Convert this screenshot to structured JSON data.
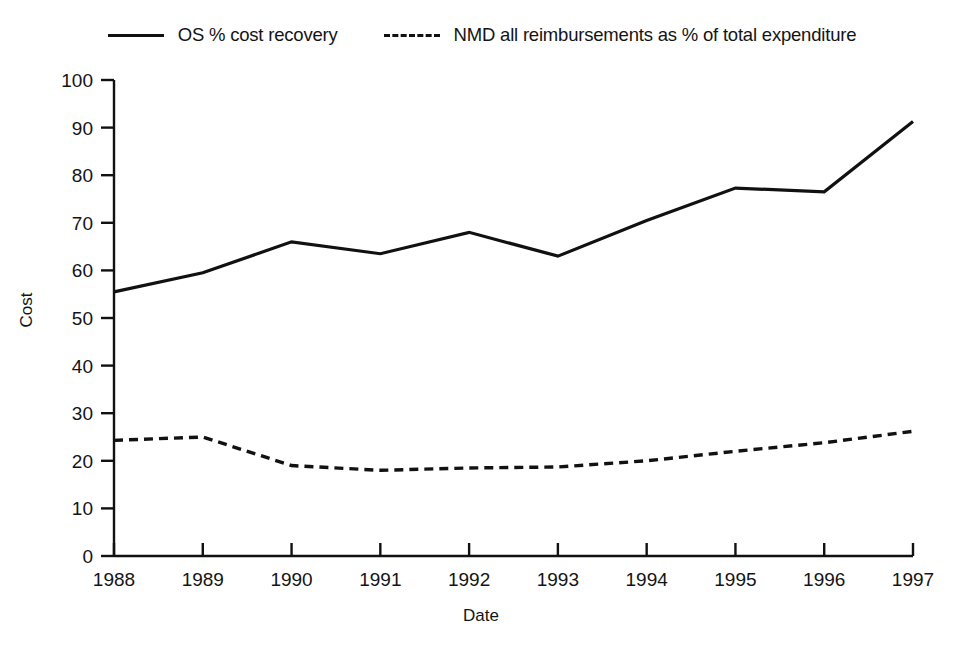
{
  "chart_data": {
    "type": "line",
    "title": "",
    "xlabel": "Date",
    "ylabel": "Cost",
    "x": [
      1988,
      1989,
      1990,
      1991,
      1992,
      1993,
      1994,
      1995,
      1996,
      1997
    ],
    "xtick_labels": [
      "1988",
      "1989",
      "1990",
      "1991",
      "1992",
      "1993",
      "1994",
      "1995",
      "1996",
      "1997"
    ],
    "ytick_labels": [
      "0",
      "10",
      "20",
      "30",
      "40",
      "50",
      "60",
      "70",
      "80",
      "90",
      "100"
    ],
    "yticks": [
      0,
      10,
      20,
      30,
      40,
      50,
      60,
      70,
      80,
      90,
      100
    ],
    "ylim": [
      0,
      100
    ],
    "xlim": [
      1988,
      1997
    ],
    "grid": false,
    "legend_position": "top-center",
    "series": [
      {
        "name": "OS % cost recovery",
        "style": "solid",
        "color": "#111111",
        "values": [
          55.5,
          59.5,
          66.0,
          63.5,
          68.0,
          63.0,
          70.5,
          77.3,
          76.5,
          91.3
        ]
      },
      {
        "name": "NMD all reimbursements as % of total expenditure",
        "style": "dashed",
        "color": "#111111",
        "values": [
          24.3,
          25.0,
          19.0,
          18.0,
          18.5,
          18.7,
          20.0,
          22.0,
          23.8,
          26.2
        ]
      }
    ]
  },
  "legend": {
    "entries": [
      {
        "label": "OS % cost recovery",
        "style": "solid"
      },
      {
        "label": "NMD all reimbursements as % of total expenditure",
        "style": "dashed"
      }
    ]
  },
  "axes": {
    "y_title": "Cost",
    "x_title": "Date"
  }
}
